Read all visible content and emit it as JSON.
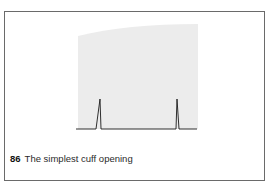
{
  "figure": {
    "number": "86",
    "caption": "The simplest cuff opening",
    "colors": {
      "shaded_area": "#ececec",
      "line": "#1a1a1a",
      "border": "#6a6a6a"
    }
  }
}
